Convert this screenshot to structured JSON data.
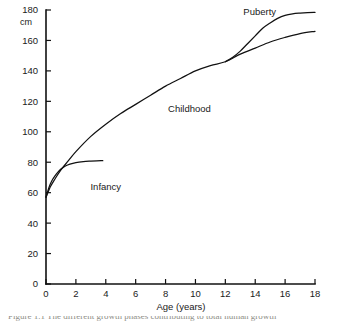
{
  "figure": {
    "unit_label": "cm",
    "caption": "Figure 1.1 The different growth phases contributing to total human growth"
  },
  "chart_data": {
    "type": "line",
    "title": "",
    "xlabel": "Age (years)",
    "ylabel": "cm",
    "xlim": [
      0,
      18
    ],
    "ylim": [
      0,
      180
    ],
    "xticks": [
      0,
      2,
      4,
      6,
      8,
      10,
      12,
      14,
      16,
      18
    ],
    "yticks": [
      0,
      20,
      40,
      60,
      80,
      100,
      120,
      140,
      160,
      180
    ],
    "grid": false,
    "legend": "none",
    "series": [
      {
        "name": "Infancy component",
        "x": [
          0,
          0.2,
          0.4,
          0.6,
          0.8,
          1.0,
          1.3,
          1.6,
          2.0,
          2.5,
          3.0,
          3.4,
          3.8
        ],
        "values": [
          57,
          63.5,
          68,
          71,
          73.5,
          75.5,
          77.5,
          78.8,
          79.8,
          80.4,
          80.7,
          80.9,
          81
        ]
      },
      {
        "name": "Childhood component",
        "x": [
          0,
          0.3,
          0.6,
          1.0,
          1.5,
          2,
          3,
          4,
          5,
          6,
          7,
          8,
          9,
          10,
          11,
          12,
          13,
          14,
          15,
          16,
          17,
          18
        ],
        "values": [
          57,
          64,
          69,
          75,
          81,
          87,
          97,
          105,
          112,
          118,
          124,
          130,
          135,
          140,
          143.5,
          146,
          151,
          155,
          159,
          162,
          164.5,
          166
        ]
      },
      {
        "name": "Puberty component",
        "x": [
          12,
          12.5,
          13,
          13.5,
          14,
          14.5,
          15,
          15.5,
          16,
          16.5,
          17,
          17.5,
          18
        ],
        "values": [
          146,
          149,
          153,
          158,
          163,
          168,
          171.5,
          174.5,
          176.5,
          177.5,
          178,
          178.3,
          178.4
        ]
      }
    ],
    "annotations": [
      {
        "label": "Infancy",
        "x": 4.0,
        "y": 62
      },
      {
        "label": "Childhood",
        "x": 9.6,
        "y": 113
      },
      {
        "label": "Puberty",
        "x": 14.3,
        "y": 177
      }
    ]
  }
}
